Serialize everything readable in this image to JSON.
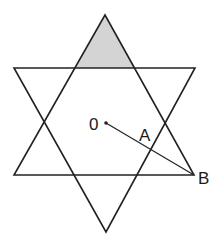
{
  "diagram": {
    "type": "hexagram",
    "colors": {
      "stroke": "#222222",
      "shade": "#d4d4d4",
      "background": "#ffffff"
    },
    "labels": {
      "center": "0",
      "point_a": "A",
      "point_b": "B"
    }
  }
}
